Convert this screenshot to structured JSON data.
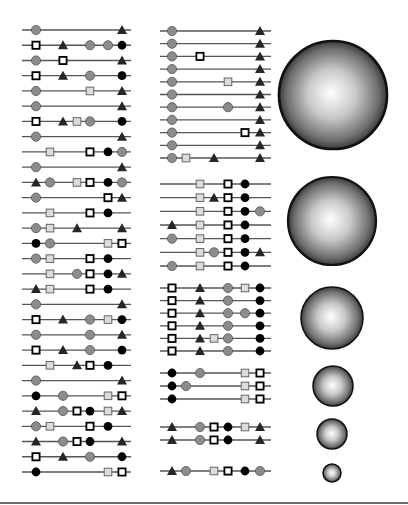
{
  "colors": {
    "line": "#555555",
    "circle_fill": "#8c8c8c",
    "dot_fill": "#000000",
    "triangle_fill": "#262626",
    "hollow_square_fill": "#ffffff",
    "light_square_fill": "#dcdcdc",
    "stroke": "#000000",
    "sphere_edge": "#111111"
  },
  "legend_shapes": {
    "c": "gray-circle",
    "d": "black-dot",
    "t": "triangle",
    "h": "hollow-square",
    "l": "light-square"
  },
  "left_panel": {
    "line_x": [
      22,
      131
    ],
    "slots": [
      36,
      50,
      63,
      77,
      90,
      108,
      122
    ],
    "row_y_start": 30,
    "row_y_end": 472,
    "rows": [
      [
        [
          "c",
          0
        ],
        [
          "t",
          6
        ]
      ],
      [
        [
          "h",
          0
        ],
        [
          "t",
          2
        ],
        [
          "c",
          4
        ],
        [
          "c",
          5
        ],
        [
          "d",
          6
        ]
      ],
      [
        [
          "c",
          0
        ],
        [
          "h",
          2
        ],
        [
          "t",
          6
        ]
      ],
      [
        [
          "h",
          0
        ],
        [
          "t",
          2
        ],
        [
          "c",
          4
        ],
        [
          "d",
          6
        ]
      ],
      [
        [
          "c",
          0
        ],
        [
          "l",
          4
        ],
        [
          "t",
          6
        ]
      ],
      [
        [
          "c",
          0
        ],
        [
          "t",
          6
        ]
      ],
      [
        [
          "h",
          0
        ],
        [
          "t",
          2
        ],
        [
          "l",
          3
        ],
        [
          "c",
          4
        ],
        [
          "d",
          6
        ]
      ],
      [
        [
          "c",
          0
        ],
        [
          "t",
          6
        ]
      ],
      [
        [
          "l",
          1
        ],
        [
          "h",
          4
        ],
        [
          "d",
          5
        ],
        [
          "c",
          6
        ]
      ],
      [
        [
          "c",
          0
        ],
        [
          "t",
          6
        ]
      ],
      [
        [
          "t",
          0
        ],
        [
          "c",
          1
        ],
        [
          "l",
          3
        ],
        [
          "h",
          4
        ],
        [
          "d",
          5
        ],
        [
          "c",
          6
        ]
      ],
      [
        [
          "c",
          0
        ],
        [
          "h",
          5
        ],
        [
          "t",
          6
        ]
      ],
      [
        [
          "l",
          1
        ],
        [
          "h",
          4
        ],
        [
          "d",
          5
        ]
      ],
      [
        [
          "c",
          0
        ],
        [
          "l",
          1
        ],
        [
          "t",
          3
        ],
        [
          "t",
          6
        ]
      ],
      [
        [
          "d",
          0
        ],
        [
          "c",
          1
        ],
        [
          "l",
          5
        ],
        [
          "h",
          6
        ]
      ],
      [
        [
          "c",
          0
        ],
        [
          "l",
          1
        ],
        [
          "h",
          4
        ],
        [
          "d",
          5
        ]
      ],
      [
        [
          "l",
          1
        ],
        [
          "c",
          3
        ],
        [
          "h",
          4
        ],
        [
          "d",
          5
        ],
        [
          "t",
          6
        ]
      ],
      [
        [
          "t",
          0
        ],
        [
          "l",
          1
        ],
        [
          "h",
          4
        ],
        [
          "d",
          5
        ]
      ],
      [
        [
          "c",
          0
        ],
        [
          "t",
          6
        ]
      ],
      [
        [
          "h",
          0
        ],
        [
          "t",
          2
        ],
        [
          "c",
          4
        ],
        [
          "l",
          5
        ],
        [
          "d",
          6
        ]
      ],
      [
        [
          "c",
          0
        ],
        [
          "c",
          4
        ],
        [
          "t",
          6
        ]
      ],
      [
        [
          "h",
          0
        ],
        [
          "t",
          2
        ],
        [
          "c",
          4
        ],
        [
          "d",
          6
        ]
      ],
      [
        [
          "l",
          1
        ],
        [
          "t",
          3
        ],
        [
          "h",
          4
        ],
        [
          "d",
          5
        ]
      ],
      [
        [
          "c",
          0
        ],
        [
          "t",
          6
        ]
      ],
      [
        [
          "d",
          0
        ],
        [
          "c",
          2
        ],
        [
          "l",
          5
        ],
        [
          "h",
          6
        ]
      ],
      [
        [
          "t",
          0
        ],
        [
          "c",
          2
        ],
        [
          "h",
          3
        ],
        [
          "d",
          4
        ],
        [
          "l",
          5
        ],
        [
          "t",
          6
        ]
      ],
      [
        [
          "c",
          0
        ],
        [
          "l",
          1
        ],
        [
          "h",
          4
        ],
        [
          "d",
          5
        ]
      ],
      [
        [
          "t",
          0
        ],
        [
          "c",
          2
        ],
        [
          "h",
          3
        ],
        [
          "d",
          4
        ],
        [
          "t",
          6
        ]
      ],
      [
        [
          "h",
          0
        ],
        [
          "t",
          2
        ],
        [
          "c",
          4
        ],
        [
          "d",
          6
        ]
      ],
      [
        [
          "d",
          0
        ],
        [
          "l",
          5
        ],
        [
          "h",
          6
        ]
      ]
    ]
  },
  "middle_panel": {
    "line_x": [
      160,
      271
    ],
    "slots": [
      172,
      186,
      200,
      214,
      228,
      245,
      260
    ],
    "groups": [
      {
        "y_start": 31,
        "y_end": 158,
        "rows": [
          [
            [
              "c",
              0
            ],
            [
              "t",
              6
            ]
          ],
          [
            [
              "c",
              0
            ],
            [
              "t",
              6
            ]
          ],
          [
            [
              "c",
              0
            ],
            [
              "h",
              2
            ],
            [
              "t",
              6
            ]
          ],
          [
            [
              "c",
              0
            ],
            [
              "t",
              6
            ]
          ],
          [
            [
              "c",
              0
            ],
            [
              "l",
              4
            ],
            [
              "t",
              6
            ]
          ],
          [
            [
              "c",
              0
            ],
            [
              "t",
              6
            ]
          ],
          [
            [
              "c",
              0
            ],
            [
              "c",
              4
            ],
            [
              "t",
              6
            ]
          ],
          [
            [
              "c",
              0
            ],
            [
              "t",
              6
            ]
          ],
          [
            [
              "c",
              0
            ],
            [
              "h",
              5
            ],
            [
              "t",
              6
            ]
          ],
          [
            [
              "c",
              0
            ],
            [
              "t",
              6
            ]
          ],
          [
            [
              "c",
              0
            ],
            [
              "l",
              1
            ],
            [
              "t",
              3
            ],
            [
              "t",
              6
            ]
          ]
        ]
      },
      {
        "y_start": 184,
        "y_end": 266,
        "rows": [
          [
            [
              "l",
              2
            ],
            [
              "h",
              4
            ],
            [
              "d",
              5
            ]
          ],
          [
            [
              "l",
              2
            ],
            [
              "t",
              3
            ],
            [
              "h",
              4
            ],
            [
              "d",
              5
            ]
          ],
          [
            [
              "l",
              2
            ],
            [
              "h",
              4
            ],
            [
              "d",
              5
            ],
            [
              "c",
              6
            ]
          ],
          [
            [
              "t",
              0
            ],
            [
              "l",
              2
            ],
            [
              "h",
              4
            ],
            [
              "d",
              5
            ]
          ],
          [
            [
              "c",
              0
            ],
            [
              "l",
              2
            ],
            [
              "h",
              4
            ],
            [
              "d",
              5
            ]
          ],
          [
            [
              "l",
              2
            ],
            [
              "c",
              3
            ],
            [
              "h",
              4
            ],
            [
              "d",
              5
            ],
            [
              "t",
              6
            ]
          ],
          [
            [
              "c",
              0
            ],
            [
              "l",
              2
            ],
            [
              "h",
              4
            ],
            [
              "d",
              5
            ]
          ]
        ]
      },
      {
        "y_start": 288,
        "y_end": 351,
        "rows": [
          [
            [
              "h",
              0
            ],
            [
              "t",
              2
            ],
            [
              "c",
              4
            ],
            [
              "l",
              5
            ],
            [
              "d",
              6
            ]
          ],
          [
            [
              "h",
              0
            ],
            [
              "t",
              2
            ],
            [
              "c",
              4
            ],
            [
              "d",
              6
            ]
          ],
          [
            [
              "h",
              0
            ],
            [
              "t",
              2
            ],
            [
              "c",
              4
            ],
            [
              "c",
              5
            ],
            [
              "d",
              6
            ]
          ],
          [
            [
              "h",
              0
            ],
            [
              "t",
              2
            ],
            [
              "c",
              4
            ],
            [
              "d",
              6
            ]
          ],
          [
            [
              "h",
              0
            ],
            [
              "t",
              2
            ],
            [
              "l",
              3
            ],
            [
              "c",
              4
            ],
            [
              "d",
              6
            ]
          ],
          [
            [
              "h",
              0
            ],
            [
              "t",
              2
            ],
            [
              "c",
              4
            ],
            [
              "d",
              6
            ]
          ]
        ]
      },
      {
        "y_start": 373,
        "y_end": 399,
        "rows": [
          [
            [
              "d",
              0
            ],
            [
              "c",
              2
            ],
            [
              "l",
              5
            ],
            [
              "h",
              6
            ]
          ],
          [
            [
              "d",
              0
            ],
            [
              "c",
              1
            ],
            [
              "l",
              5
            ],
            [
              "h",
              6
            ]
          ],
          [
            [
              "d",
              0
            ],
            [
              "l",
              5
            ],
            [
              "h",
              6
            ]
          ]
        ]
      },
      {
        "y_start": 427,
        "y_end": 440,
        "rows": [
          [
            [
              "t",
              0
            ],
            [
              "c",
              2
            ],
            [
              "h",
              3
            ],
            [
              "d",
              4
            ],
            [
              "l",
              5
            ],
            [
              "t",
              6
            ]
          ],
          [
            [
              "t",
              0
            ],
            [
              "c",
              2
            ],
            [
              "h",
              3
            ],
            [
              "d",
              4
            ],
            [
              "t",
              6
            ]
          ]
        ]
      },
      {
        "y_start": 471,
        "y_end": 471,
        "rows": [
          [
            [
              "t",
              0
            ],
            [
              "c",
              1
            ],
            [
              "l",
              3
            ],
            [
              "h",
              4
            ],
            [
              "d",
              5
            ],
            [
              "c",
              6
            ]
          ]
        ]
      }
    ]
  },
  "spheres": [
    {
      "cx": 333,
      "cy": 95,
      "r": 54
    },
    {
      "cx": 332,
      "cy": 221,
      "r": 44
    },
    {
      "cx": 332,
      "cy": 318,
      "r": 31
    },
    {
      "cx": 333,
      "cy": 386,
      "r": 20
    },
    {
      "cx": 332,
      "cy": 434,
      "r": 15
    },
    {
      "cx": 332,
      "cy": 473,
      "r": 9
    }
  ]
}
